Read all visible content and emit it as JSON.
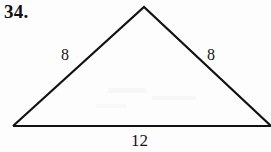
{
  "figure": {
    "problem_number": "34.",
    "shape": "triangle",
    "background_color": "#fdfdfd",
    "stroke_color": "#111111",
    "stroke_width": 2,
    "vertices": {
      "apex": {
        "x": 144,
        "y": 7
      },
      "bottom_left": {
        "x": 13,
        "y": 126
      },
      "bottom_right": {
        "x": 271,
        "y": 126
      }
    },
    "labels": {
      "left_leg": "8",
      "right_leg": "8",
      "base": "12"
    }
  },
  "chart_data": {
    "type": "diagram",
    "title": "34.",
    "shape": "isosceles triangle",
    "side_lengths": [
      {
        "side": "left leg",
        "value": 8
      },
      {
        "side": "right leg",
        "value": 8
      },
      {
        "side": "base",
        "value": 12
      }
    ],
    "annotations": [
      "8",
      "8",
      "12"
    ]
  }
}
